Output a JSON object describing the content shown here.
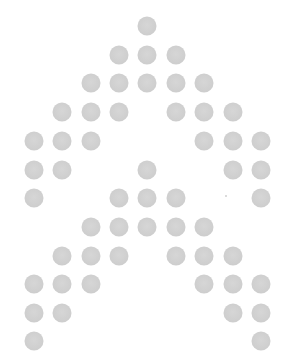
{
  "pattern": {
    "name": "dot-matrix-chevron-pattern",
    "background": "#ffffff",
    "dot_color": "#cfcfcf",
    "dot_diameter": 19,
    "columns_x": [
      34,
      62,
      91,
      119,
      147,
      176,
      204,
      233,
      261
    ],
    "rows_y": [
      26,
      55,
      83,
      112,
      141,
      170,
      198,
      227,
      256,
      284,
      313,
      341
    ],
    "rows": [
      [
        4
      ],
      [
        3,
        4,
        5
      ],
      [
        2,
        3,
        4,
        5,
        6
      ],
      [
        1,
        2,
        3,
        5,
        6,
        7
      ],
      [
        0,
        1,
        2,
        6,
        7,
        8
      ],
      [
        0,
        1,
        4,
        7,
        8
      ],
      [
        0,
        3,
        4,
        5,
        8
      ],
      [
        2,
        3,
        4,
        5,
        6
      ],
      [
        1,
        2,
        3,
        5,
        6,
        7
      ],
      [
        0,
        1,
        2,
        6,
        7,
        8
      ],
      [
        0,
        1,
        7,
        8
      ],
      [
        0,
        8
      ]
    ],
    "specks": [
      {
        "x": 225,
        "y": 195
      }
    ]
  }
}
